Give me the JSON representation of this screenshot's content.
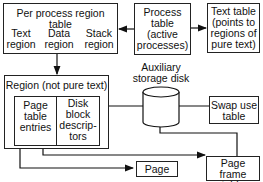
{
  "diagram": {
    "per_process_region_table": {
      "title": "Per process region table",
      "text_region": "Text\nregion",
      "data_region": "Data\nregion",
      "stack_region": "Stack\nregion"
    },
    "process_table": "Process\ntable\n(active\nprocesses)",
    "text_table": "Text table\n(points to\nregions of\npure text)",
    "auxiliary_storage_disk": "Auxiliary\nstorage disk",
    "region": {
      "title": "Region (not pure text)",
      "page_table_entries": "Page\ntable\nentries",
      "disk_block_descriptors": "Disk\nblock\ndescrip-\ntors"
    },
    "swap_use_table": "Swap  use\ntable",
    "page_frame_table": "Page frame\ntable",
    "page": "Page"
  }
}
